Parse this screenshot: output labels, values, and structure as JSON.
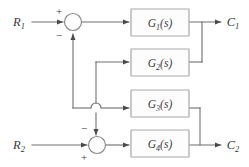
{
  "diagram": {
    "type": "control-system-block-diagram",
    "title": "",
    "canvas": {
      "width": 249,
      "height": 167,
      "background": "#ffffff"
    },
    "colors": {
      "wire": "#6e6e6e",
      "block_stroke": "#a8a8a8",
      "block_fill": "#fdfdfd",
      "text": "#3a3a3a",
      "arrow": "#4a4a4a"
    },
    "inputs": [
      {
        "id": "R1",
        "base": "R",
        "sub": "1",
        "label": "R₁",
        "x": 20,
        "y": 22
      },
      {
        "id": "R2",
        "base": "R",
        "sub": "2",
        "label": "R₂",
        "x": 20,
        "y": 145
      }
    ],
    "outputs": [
      {
        "id": "C1",
        "base": "C",
        "sub": "1",
        "label": "C₁",
        "x": 232,
        "y": 22
      },
      {
        "id": "C2",
        "base": "C",
        "sub": "2",
        "label": "C₂",
        "x": 232,
        "y": 146
      }
    ],
    "blocks": [
      {
        "id": "G1",
        "base": "G",
        "sub": "1",
        "arg": "(s)",
        "label": "G₁(s)",
        "x": 131,
        "y": 9,
        "w": 58,
        "h": 27
      },
      {
        "id": "G2",
        "base": "G",
        "sub": "2",
        "arg": "(s)",
        "label": "G₂(s)",
        "x": 131,
        "y": 49,
        "w": 58,
        "h": 27
      },
      {
        "id": "G3",
        "base": "G",
        "sub": "3",
        "arg": "(s)",
        "label": "G₃(s)",
        "x": 131,
        "y": 90,
        "w": 58,
        "h": 27
      },
      {
        "id": "G4",
        "base": "G",
        "sub": "4",
        "arg": "(s)",
        "label": "G₄(s)",
        "x": 131,
        "y": 130,
        "w": 58,
        "h": 27
      },
      {
        "id": "G5-visual-dup",
        "hidden": true,
        "label": ""
      }
    ],
    "summing_junctions": [
      {
        "id": "sum-top",
        "cx": 73,
        "cy": 22,
        "r": 8,
        "signs": [
          {
            "label": "+",
            "position": "top-left",
            "x": 60,
            "y": 13,
            "for_input": "R1"
          },
          {
            "label": "−",
            "position": "bottom-left",
            "x": 60,
            "y": 37,
            "for_input": "feedback-from-G3"
          }
        ]
      },
      {
        "id": "sum-bottom",
        "cx": 97,
        "cy": 145,
        "r": 8,
        "signs": [
          {
            "label": "−",
            "position": "top-left",
            "x": 85,
            "y": 130,
            "for_input": "feedback-from-G2"
          },
          {
            "label": "+",
            "position": "bottom-left",
            "x": 85,
            "y": 159,
            "for_input": "R2"
          }
        ]
      }
    ],
    "connections": [
      {
        "from": "R1",
        "to": "sum-top",
        "kind": "forward"
      },
      {
        "from": "sum-top",
        "to": "G1",
        "kind": "forward"
      },
      {
        "from": "G1",
        "to": "C1",
        "kind": "forward"
      },
      {
        "from": "C1-node",
        "to": "G2-output-line",
        "kind": "tap"
      },
      {
        "from": "G2",
        "to": "sum-bottom",
        "kind": "cross-feedback",
        "sign": "−"
      },
      {
        "from": "G3",
        "to": "sum-top",
        "kind": "cross-feedback",
        "sign": "−"
      },
      {
        "from": "R2",
        "to": "sum-bottom",
        "kind": "forward"
      },
      {
        "from": "sum-bottom",
        "to": "G4",
        "kind": "forward"
      },
      {
        "from": "G4",
        "to": "C2",
        "kind": "forward"
      },
      {
        "from": "C2-node",
        "to": "G3-output-line",
        "kind": "tap"
      }
    ],
    "crossover": {
      "x": 96,
      "y": 108,
      "style": "hop-semicircle",
      "note": "G3 feedback line hops over G2 feedback line"
    }
  }
}
